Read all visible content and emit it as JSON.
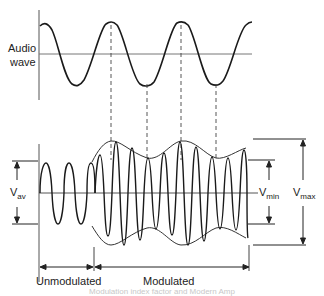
{
  "diagram": {
    "audio_wave_label_line1": "Audio",
    "audio_wave_label_line2": "wave",
    "v_av": {
      "main": "V",
      "sub": "av"
    },
    "v_min": {
      "main": "V",
      "sub": "min"
    },
    "v_max": {
      "main": "V",
      "sub": "max"
    },
    "unmodulated_label": "Unmodulated",
    "modulated_label": "Modulated",
    "caption_partial": "Modulation index factor and Modern Amp"
  },
  "colors": {
    "stroke": "#1a1a1a",
    "axis": "#555555",
    "dashed": "#444444",
    "background": "#ffffff"
  }
}
